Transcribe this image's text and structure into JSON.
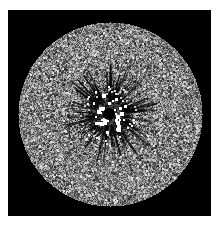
{
  "image": {
    "width": 219,
    "height": 226,
    "background": "#ffffff",
    "frame": {
      "x": 8,
      "y": 10,
      "w": 203,
      "h": 206,
      "color": "#000000"
    },
    "disk": {
      "cx": 110,
      "cy": 114,
      "r": 92,
      "base_gray": 128,
      "noise_amplitude": 70,
      "grain": 2
    },
    "center_feature": {
      "cx": 109,
      "cy": 114,
      "core_radius": 6,
      "core_color": "#000000",
      "bright_dot_ring_inner": 6,
      "bright_dot_ring_outer": 19,
      "bright_dot_color": "#ffffff",
      "bright_dot_count": 34,
      "streak_region_radius": 46,
      "streak_count": 140,
      "streak_color": "#000000"
    },
    "seed": 20240611
  }
}
